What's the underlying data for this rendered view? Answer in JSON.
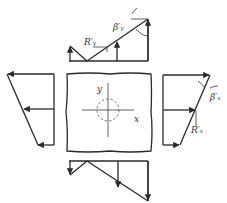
{
  "diagram": {
    "type": "stress-distribution",
    "labels": {
      "top_angle": "β′ᵧ",
      "top_force": "R′ᵧ",
      "right_angle": "β′ₓ",
      "right_force": "R′ₓ",
      "axis_x": "x",
      "axis_y": "y"
    },
    "colors": {
      "line": "#2a2a2a",
      "background": "#ffffff"
    }
  }
}
